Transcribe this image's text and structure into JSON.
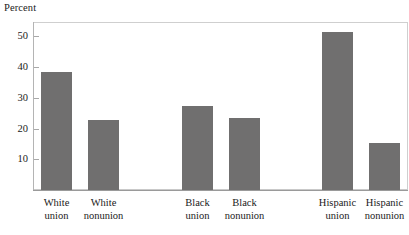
{
  "chart_data": {
    "type": "bar",
    "title": "",
    "subtitle": "",
    "ylabel": "Percent",
    "xlabel": "",
    "categories": [
      "White union",
      "White nonunion",
      "Black union",
      "Black nonunion",
      "Hispanic union",
      "Hispanic nonunion"
    ],
    "category_lines": [
      [
        "White",
        "union"
      ],
      [
        "White",
        "nonunion"
      ],
      [
        "Black",
        "union"
      ],
      [
        "Black",
        "nonunion"
      ],
      [
        "Hispanic",
        "union"
      ],
      [
        "Hispanic",
        "nonunion"
      ]
    ],
    "values": [
      38.3,
      22.7,
      27.2,
      23.3,
      51.5,
      15.3
    ],
    "ylim": [
      0,
      55
    ],
    "yticks": [
      10,
      20,
      30,
      40,
      50
    ],
    "ytick_labels": [
      "10",
      "20",
      "30",
      "40",
      "50"
    ],
    "grid": false,
    "legend": null,
    "bar_color": "#706f6f",
    "axis_color": "#a8a8a8",
    "background_color": "#ffffff"
  },
  "axis": {
    "y_title": "Percent"
  }
}
